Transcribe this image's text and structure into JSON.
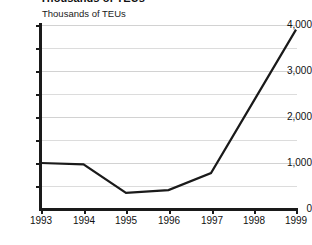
{
  "chart_data": {
    "type": "line",
    "title": "Thousands of TEUs",
    "axis_note": "Thousands of TEUs",
    "xlabel": "",
    "ylabel": "Thousands of TEUs",
    "categories": [
      "1993",
      "1994",
      "1995",
      "1996",
      "1997",
      "1998",
      "1999"
    ],
    "values": [
      1000,
      970,
      350,
      410,
      780,
      2340,
      3900
    ],
    "series": [
      {
        "name": "Container volume",
        "values": [
          1000,
          970,
          350,
          410,
          780,
          2340,
          3900
        ]
      }
    ],
    "ylim": [
      0,
      4000
    ],
    "ytick_labels": [
      "0",
      "1,000",
      "2,000",
      "3,000",
      "4,000"
    ],
    "ytick_values": [
      0,
      1000,
      2000,
      3000,
      4000
    ],
    "minor_gridline_values": [
      500,
      1500,
      2500,
      3500
    ],
    "xtick_labels": [
      "1993",
      "1994",
      "1995",
      "1996",
      "1997",
      "1998",
      "1999"
    ],
    "grid": true,
    "legend": "none",
    "line_color": "#1a1a1a",
    "grid_color": "#dcdcdc",
    "axis_color": "#1a1a1a"
  }
}
